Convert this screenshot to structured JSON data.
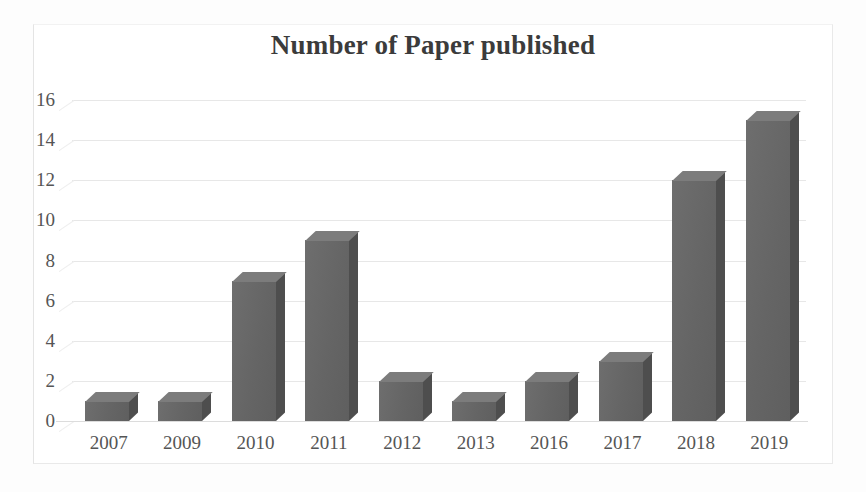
{
  "chart_data": {
    "type": "bar",
    "title": "Number of Paper published",
    "xlabel": "",
    "ylabel": "",
    "categories": [
      "2007",
      "2009",
      "2010",
      "2011",
      "2012",
      "2013",
      "2016",
      "2017",
      "2018",
      "2019"
    ],
    "values": [
      1,
      1,
      7,
      9,
      2,
      1,
      2,
      3,
      12,
      15
    ],
    "yticks": [
      0,
      2,
      4,
      6,
      8,
      10,
      12,
      14,
      16
    ],
    "ylim": [
      0,
      16
    ],
    "grid": true,
    "legend": false,
    "style": "3d-column",
    "series": [
      {
        "name": "Number of Paper published",
        "values": [
          1,
          1,
          7,
          9,
          2,
          1,
          2,
          3,
          12,
          15
        ]
      }
    ],
    "colors": {
      "bar_front": "#6a6a6a",
      "bar_top": "#7c7c7c",
      "bar_side": "#4e4e4e",
      "gridline": "#e3e3e3",
      "text": "#555555",
      "title": "#3b3b3b",
      "background": "#ffffff"
    }
  }
}
